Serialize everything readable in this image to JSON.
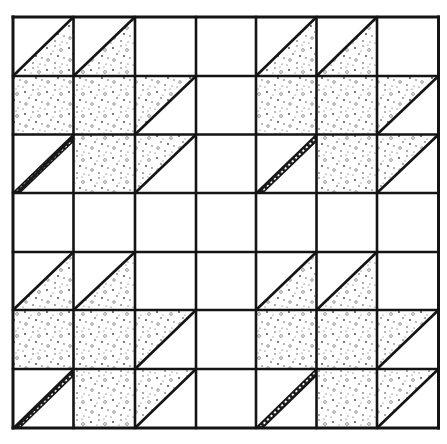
{
  "diagram": {
    "type": "quilt-block-pattern",
    "grid": {
      "rows": 7,
      "cols": 7
    },
    "colors": {
      "line": "#141414",
      "background": "#ffffff",
      "stipple_dot": "#3a3a3a"
    },
    "cell_legend": {
      "E": "empty",
      "F": "full-stipple",
      "BR": "lower-right-triangle-stipple",
      "TL": "upper-left-triangle-stipple",
      "S": "diagonal-stem-band"
    },
    "cells": [
      [
        "BR",
        "BR",
        "E",
        "E",
        "BR",
        "BR",
        "E"
      ],
      [
        "F",
        "F",
        "TL",
        "E",
        "F",
        "F",
        "TL"
      ],
      [
        "S",
        "F",
        "TL",
        "E",
        "S",
        "F",
        "TL"
      ],
      [
        "E",
        "E",
        "E",
        "E",
        "E",
        "E",
        "E"
      ],
      [
        "BR",
        "BR",
        "E",
        "E",
        "BR",
        "BR",
        "E"
      ],
      [
        "F",
        "F",
        "TL",
        "E",
        "F",
        "F",
        "TL"
      ],
      [
        "S",
        "F",
        "TL",
        "E",
        "S",
        "F",
        "TL"
      ]
    ]
  }
}
